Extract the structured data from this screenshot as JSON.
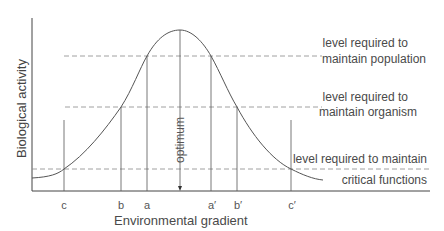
{
  "diagram": {
    "type": "tolerance-curve",
    "x_axis_label": "Environmental gradient",
    "y_axis_label": "Biological activity",
    "optimum_label": "optimum",
    "tick_labels": [
      "c",
      "b",
      "a",
      "a′",
      "b′",
      "c′"
    ],
    "levels": [
      {
        "line1": "level required to",
        "line2": "maintain population"
      },
      {
        "line1": "level required to",
        "line2": "maintain organism"
      },
      {
        "line1": "level required to maintain",
        "line2": "critical functions"
      }
    ],
    "colors": {
      "line": "#555555",
      "dashed": "#888888",
      "text": "#4a4a4a"
    }
  }
}
